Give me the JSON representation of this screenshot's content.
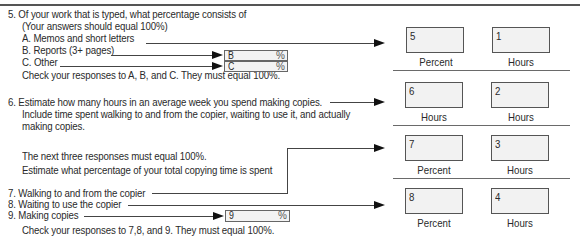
{
  "q5": {
    "title": "5. Of your work that is typed, what percentage consists of",
    "subtitle": "(Your answers should equal 100%)",
    "a": "A. Memos and short letters",
    "b": "B. Reports (3+ pages)",
    "c": "C. Other",
    "check": "Check your responses to A, B, and C. They must equal 100%.",
    "box_b": {
      "code": "B",
      "unit": "%"
    },
    "box_c": {
      "code": "C",
      "unit": "%"
    }
  },
  "q6": {
    "line1": "6. Estimate how many hours in an average week you spend making copies.",
    "line2": "Include time spent walking to and from the copier, waiting to use it, and actually",
    "line3": "making copies."
  },
  "intro": {
    "line1": "The next three responses must equal 100%.",
    "line2": "Estimate what percentage of your total copying time is spent"
  },
  "q7": "7. Walking to and from the copier",
  "q8": "8. Waiting to use the copier",
  "q9": {
    "label": "9. Making copies",
    "box": {
      "code": "9",
      "unit": "%"
    }
  },
  "check_789": "Check your responses to 7,8, and 9. They must equal 100%.",
  "answer_rows": [
    {
      "left": {
        "code": "5",
        "caption": "Percent"
      },
      "right": {
        "code": "1",
        "caption": "Hours"
      }
    },
    {
      "left": {
        "code": "6",
        "caption": "Hours"
      },
      "right": {
        "code": "2",
        "caption": "Hours"
      }
    },
    {
      "left": {
        "code": "7",
        "caption": "Percent"
      },
      "right": {
        "code": "3",
        "caption": "Hours"
      }
    },
    {
      "left": {
        "code": "8",
        "caption": "Percent"
      },
      "right": {
        "code": "4",
        "caption": "Hours"
      }
    }
  ]
}
